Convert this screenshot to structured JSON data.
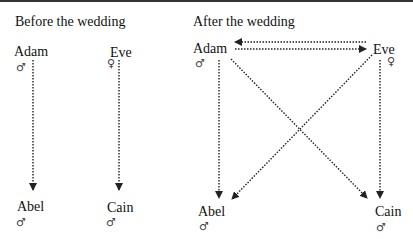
{
  "panels": [
    {
      "title": "Before the wedding",
      "nodes": [
        {
          "name": "Adam",
          "symbol": "♂"
        },
        {
          "name": "Eve",
          "symbol": "♀"
        },
        {
          "name": "Abel",
          "symbol": "♂"
        },
        {
          "name": "Cain",
          "symbol": "♂"
        }
      ],
      "edges": [
        {
          "from": "Adam",
          "to": "Abel"
        },
        {
          "from": "Eve",
          "to": "Cain"
        }
      ]
    },
    {
      "title": "After the wedding",
      "nodes": [
        {
          "name": "Adam",
          "symbol": "♂"
        },
        {
          "name": "Eve",
          "symbol": "♀"
        },
        {
          "name": "Abel",
          "symbol": "♂"
        },
        {
          "name": "Cain",
          "symbol": "♂"
        }
      ],
      "edges": [
        {
          "from": "Adam",
          "to": "Eve"
        },
        {
          "from": "Eve",
          "to": "Adam"
        },
        {
          "from": "Adam",
          "to": "Abel"
        },
        {
          "from": "Adam",
          "to": "Cain"
        },
        {
          "from": "Eve",
          "to": "Abel"
        },
        {
          "from": "Eve",
          "to": "Cain"
        }
      ]
    }
  ],
  "colors": {
    "line": "#222222",
    "text": "#111111",
    "symbol": "#444444"
  }
}
